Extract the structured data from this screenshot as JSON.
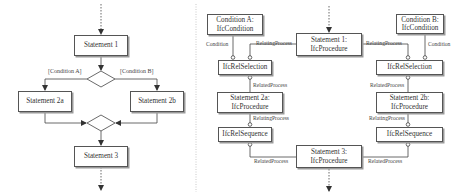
{
  "left_flowchart": {
    "statement1": "Statement 1",
    "condition_a": "[Condition A]",
    "condition_b": "[Condition B]",
    "statement2a": "Statement 2a",
    "statement2b": "Statement 2b",
    "statement3": "Statement 3"
  },
  "right_model": {
    "condition_a": {
      "line1": "Condition A:",
      "line2": "IfcCondition"
    },
    "condition_b": {
      "line1": "Condition B:",
      "line2": "IfcCondition"
    },
    "statement1": {
      "line1": "Statement 1:",
      "line2": "IfcProcedure"
    },
    "statement2a": {
      "line1": "Statement 2a:",
      "line2": "IfcProcedure"
    },
    "statement2b": {
      "line1": "Statement 2b:",
      "line2": "IfcProcedure"
    },
    "statement3": {
      "line1": "Statement 3:",
      "line2": "IfcProcedure"
    },
    "rel_selection_left": "IfcRelSelection",
    "rel_selection_right": "IfcRelSelection",
    "rel_sequence_left": "IfcRelSequence",
    "rel_sequence_right": "IfcRelSequence",
    "labels": {
      "condition_left": "Condition",
      "condition_right": "Condition",
      "relating_process_top_left": "RelatingProcess",
      "relating_process_top_right": "RelatingProcess",
      "related_process_left": "RelatedProcess",
      "related_process_right": "RelatedProcess",
      "relating_process_mid_left": "RelatingProcess",
      "relating_process_mid_right": "RelatingProcess",
      "related_process_bottom_left": "RelatedProcess",
      "related_process_bottom_right": "RelatedProcess"
    }
  }
}
